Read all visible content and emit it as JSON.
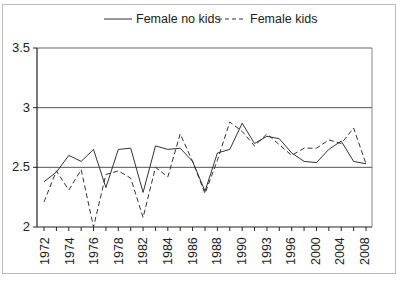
{
  "chart_data": {
    "type": "line",
    "title": "",
    "xlabel": "",
    "ylabel": "",
    "ylim": [
      2,
      3.5
    ],
    "yticks": [
      "2",
      "2.5",
      "3",
      "3.5"
    ],
    "x_tick_labels": [
      "1972",
      "1974",
      "1976",
      "1978",
      "1982",
      "1984",
      "1986",
      "1988",
      "1990",
      "1993",
      "1996",
      "2000",
      "2004",
      "2008"
    ],
    "grid": "horizontal at 2.5 and 3",
    "legend_position": "top",
    "x": [
      1972,
      1973,
      1974,
      1975,
      1976,
      1977,
      1978,
      1980,
      1982,
      1983,
      1984,
      1985,
      1986,
      1987,
      1988,
      1989,
      1990,
      1991,
      1993,
      1994,
      1996,
      1998,
      2000,
      2002,
      2004,
      2006,
      2008
    ],
    "series": [
      {
        "name": "Female no kids",
        "style": "solid",
        "values": [
          2.38,
          2.46,
          2.6,
          2.55,
          2.65,
          2.33,
          2.65,
          2.66,
          2.29,
          2.68,
          2.65,
          2.66,
          2.55,
          2.3,
          2.62,
          2.65,
          2.87,
          2.7,
          2.76,
          2.74,
          2.62,
          2.55,
          2.54,
          2.65,
          2.72,
          2.55,
          2.53
        ]
      },
      {
        "name": "Female kids",
        "style": "dashed",
        "values": [
          2.21,
          2.47,
          2.31,
          2.48,
          2.0,
          2.44,
          2.47,
          2.41,
          2.08,
          2.5,
          2.42,
          2.78,
          2.55,
          2.28,
          2.56,
          2.88,
          2.8,
          2.68,
          2.78,
          2.69,
          2.6,
          2.66,
          2.66,
          2.73,
          2.7,
          2.83,
          2.53
        ]
      }
    ]
  },
  "legend": {
    "series1": "Female no kids",
    "series2": "Female kids"
  },
  "footer": "SOURCE: GSS 1972–2008"
}
